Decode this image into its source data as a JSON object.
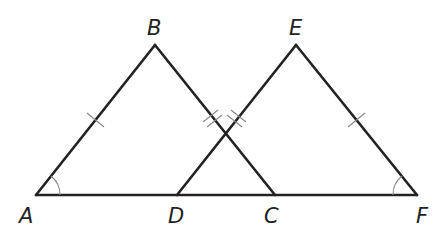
{
  "diagram": {
    "type": "geometry",
    "points": {
      "A": {
        "label": "A",
        "x": 36,
        "y": 195
      },
      "B": {
        "label": "B",
        "x": 155,
        "y": 45
      },
      "C": {
        "label": "C",
        "x": 275,
        "y": 195
      },
      "D": {
        "label": "D",
        "x": 177,
        "y": 195
      },
      "E": {
        "label": "E",
        "x": 296,
        "y": 45
      },
      "F": {
        "label": "F",
        "x": 417,
        "y": 195
      }
    },
    "segments": [
      "AB",
      "BC",
      "DE",
      "EF",
      "AF"
    ],
    "congruence_marks": {
      "single": [
        "AB",
        "EF"
      ],
      "double": [
        "BC",
        "DE"
      ]
    },
    "angle_marks": [
      "A",
      "F"
    ],
    "colors": {
      "line": "#222222",
      "mark": "#8a8a8a",
      "background": "#ffffff"
    }
  }
}
